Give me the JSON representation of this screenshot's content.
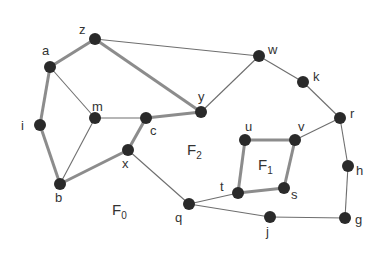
{
  "diagram": {
    "type": "planar-graph",
    "colors": {
      "node": "#2a2a2a",
      "thin_edge": "#6e6e6e",
      "thick_edge": "#8c8c8c",
      "text": "#333333"
    },
    "nodes": [
      {
        "id": "z",
        "label": "z",
        "x": 95,
        "y": 39,
        "lx": 79,
        "ly": 34
      },
      {
        "id": "a",
        "label": "a",
        "x": 50,
        "y": 67,
        "lx": 42,
        "ly": 55
      },
      {
        "id": "m",
        "label": "m",
        "x": 95,
        "y": 118,
        "lx": 92,
        "ly": 111
      },
      {
        "id": "c",
        "label": "c",
        "x": 146,
        "y": 118,
        "lx": 150,
        "ly": 135
      },
      {
        "id": "y",
        "label": "y",
        "x": 201,
        "y": 112,
        "lx": 198,
        "ly": 101
      },
      {
        "id": "w",
        "label": "w",
        "x": 259,
        "y": 56,
        "lx": 268,
        "ly": 54
      },
      {
        "id": "k",
        "label": "k",
        "x": 303,
        "y": 82,
        "lx": 313,
        "ly": 81
      },
      {
        "id": "r",
        "label": "r",
        "x": 340,
        "y": 118,
        "lx": 350,
        "ly": 118
      },
      {
        "id": "i",
        "label": "i",
        "x": 40,
        "y": 125,
        "lx": 21,
        "ly": 130
      },
      {
        "id": "b",
        "label": "b",
        "x": 60,
        "y": 184,
        "lx": 55,
        "ly": 202
      },
      {
        "id": "x",
        "label": "x",
        "x": 128,
        "y": 150,
        "lx": 122,
        "ly": 168
      },
      {
        "id": "q",
        "label": "q",
        "x": 189,
        "y": 204,
        "lx": 175,
        "ly": 222
      },
      {
        "id": "t",
        "label": "t",
        "x": 238,
        "y": 193,
        "lx": 220,
        "ly": 191
      },
      {
        "id": "s",
        "label": "s",
        "x": 284,
        "y": 188,
        "lx": 291,
        "ly": 199
      },
      {
        "id": "u",
        "label": "u",
        "x": 245,
        "y": 140,
        "lx": 245,
        "ly": 131
      },
      {
        "id": "v",
        "label": "v",
        "x": 295,
        "y": 140,
        "lx": 298,
        "ly": 131
      },
      {
        "id": "h",
        "label": "h",
        "x": 348,
        "y": 166,
        "lx": 356,
        "ly": 175
      },
      {
        "id": "g",
        "label": "g",
        "x": 345,
        "y": 218,
        "lx": 355,
        "ly": 224
      },
      {
        "id": "j",
        "label": "j",
        "x": 270,
        "y": 217,
        "lx": 266,
        "ly": 236
      }
    ],
    "edges": [
      {
        "from": "z",
        "to": "a",
        "weight": "thick"
      },
      {
        "from": "z",
        "to": "y",
        "weight": "thick"
      },
      {
        "from": "a",
        "to": "i",
        "weight": "thick"
      },
      {
        "from": "i",
        "to": "b",
        "weight": "thick"
      },
      {
        "from": "b",
        "to": "x",
        "weight": "thick"
      },
      {
        "from": "x",
        "to": "c",
        "weight": "thick"
      },
      {
        "from": "c",
        "to": "y",
        "weight": "thick"
      },
      {
        "from": "u",
        "to": "v",
        "weight": "thick"
      },
      {
        "from": "v",
        "to": "s",
        "weight": "thick"
      },
      {
        "from": "s",
        "to": "t",
        "weight": "thick"
      },
      {
        "from": "t",
        "to": "u",
        "weight": "thick"
      },
      {
        "from": "z",
        "to": "w",
        "weight": "thin"
      },
      {
        "from": "w",
        "to": "y",
        "weight": "thin"
      },
      {
        "from": "w",
        "to": "k",
        "weight": "thin"
      },
      {
        "from": "k",
        "to": "r",
        "weight": "thin"
      },
      {
        "from": "r",
        "to": "v",
        "weight": "thin"
      },
      {
        "from": "r",
        "to": "h",
        "weight": "thin"
      },
      {
        "from": "h",
        "to": "g",
        "weight": "thin"
      },
      {
        "from": "g",
        "to": "j",
        "weight": "thin"
      },
      {
        "from": "j",
        "to": "q",
        "weight": "thin"
      },
      {
        "from": "q",
        "to": "t",
        "weight": "thin"
      },
      {
        "from": "q",
        "to": "x",
        "weight": "thin"
      },
      {
        "from": "a",
        "to": "m",
        "weight": "thin"
      },
      {
        "from": "m",
        "to": "c",
        "weight": "thin"
      },
      {
        "from": "m",
        "to": "b",
        "weight": "thin"
      }
    ],
    "faces": [
      {
        "id": "F0",
        "base": "F",
        "sub": "0",
        "x": 112,
        "y": 215
      },
      {
        "id": "F1",
        "base": "F",
        "sub": "1",
        "x": 258,
        "y": 170
      },
      {
        "id": "F2",
        "base": "F",
        "sub": "2",
        "x": 187,
        "y": 155
      }
    ]
  }
}
